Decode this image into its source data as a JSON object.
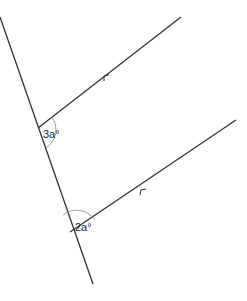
{
  "diagram": {
    "type": "parallel-lines-transversal",
    "angles": [
      {
        "label": "3a°",
        "position": "upper-intersection"
      },
      {
        "label": "2a°",
        "position": "lower-intersection"
      }
    ],
    "parallel_marker": "arrow",
    "colors": {
      "line": "#333333",
      "arc": "#888888",
      "text": "#222222"
    }
  }
}
